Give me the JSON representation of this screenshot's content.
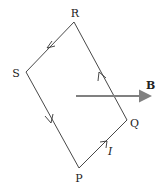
{
  "diagram": {
    "type": "current-loop-in-magnetic-field",
    "vertices": [
      {
        "id": "R",
        "label": "R",
        "x": 74,
        "y": 22,
        "label_x": 75,
        "label_y": 17
      },
      {
        "id": "S",
        "label": "S",
        "x": 26,
        "y": 72,
        "label_x": 16,
        "label_y": 77
      },
      {
        "id": "P",
        "label": "P",
        "x": 79,
        "y": 168,
        "label_x": 79,
        "label_y": 182
      },
      {
        "id": "Q",
        "label": "Q",
        "x": 127,
        "y": 120,
        "label_x": 130,
        "label_y": 127
      }
    ],
    "edges": [
      {
        "from": "R",
        "to": "S"
      },
      {
        "from": "S",
        "to": "P"
      },
      {
        "from": "P",
        "to": "Q"
      },
      {
        "from": "Q",
        "to": "R"
      }
    ],
    "current": {
      "label": "I",
      "direction": "P→Q→R→S→P",
      "label_x": 108,
      "label_y": 155
    },
    "field": {
      "label": "B",
      "x1": 76,
      "y1": 96,
      "x2": 156,
      "y2": 96,
      "color": "#808080",
      "label_x": 146,
      "label_y": 89
    },
    "line_color": "#333333"
  }
}
